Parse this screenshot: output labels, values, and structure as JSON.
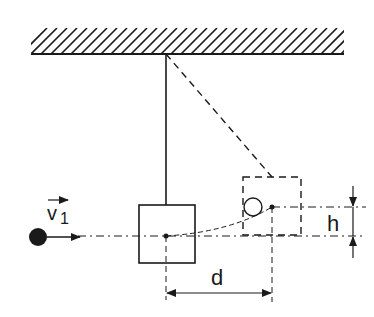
{
  "diagram": {
    "colors": {
      "ink": "#1a1a1a",
      "background": "#ffffff"
    },
    "labels": {
      "velocity_symbol": "v",
      "velocity_subscript": "1",
      "horizontal_displacement": "d",
      "height_rise": "h"
    },
    "elements": {
      "ceiling": {
        "x1": 31,
        "x2": 344,
        "y_top": 28,
        "y_bottom": 54,
        "hatch_spacing": 10
      },
      "pivot": {
        "x": 166,
        "y": 54
      },
      "block_rest": {
        "x": 139,
        "y": 205,
        "width": 56,
        "height": 58,
        "center": [
          166,
          236
        ]
      },
      "block_raised": {
        "x": 243,
        "y": 177,
        "width": 58,
        "height": 58,
        "center": [
          272,
          207
        ],
        "style": "dashed"
      },
      "projectile": {
        "cx": 38,
        "cy": 237,
        "r": 9
      },
      "embedded_projectile": {
        "cx": 253,
        "cy": 207,
        "r": 9
      }
    }
  }
}
